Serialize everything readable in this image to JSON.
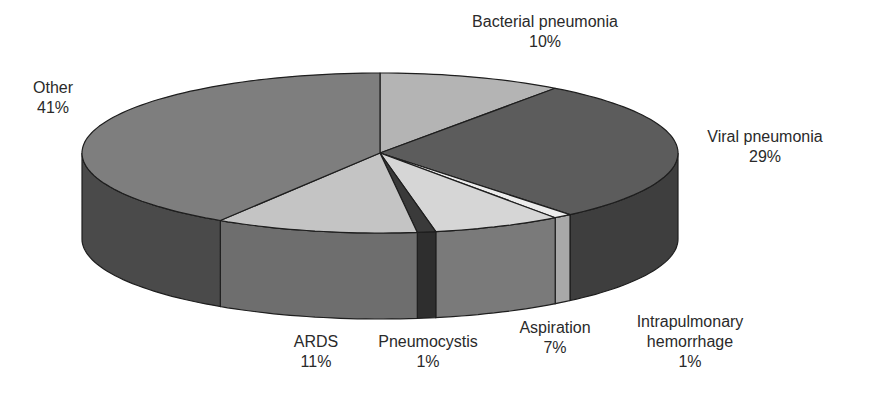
{
  "chart_data": {
    "type": "pie",
    "style": "3d-grayscale",
    "title": "",
    "start_angle_deg": 0,
    "direction": "clockwise",
    "slices": [
      {
        "name": "Bacterial pneumonia",
        "value": 10,
        "label_pct": "10%",
        "top": "#b4b4b4",
        "side": "#8c8c8c"
      },
      {
        "name": "Viral pneumonia",
        "value": 29,
        "label_pct": "29%",
        "top": "#5c5c5c",
        "side": "#3e3e3e"
      },
      {
        "name": "Intrapulmonary hemorrhage",
        "value": 1,
        "label_pct": "1%",
        "top": "#ececec",
        "side": "#a8a8a8"
      },
      {
        "name": "Aspiration",
        "value": 7,
        "label_pct": "7%",
        "top": "#d6d6d6",
        "side": "#7a7a7a"
      },
      {
        "name": "Pneumocystis",
        "value": 1,
        "label_pct": "1%",
        "top": "#3a3a3a",
        "side": "#2e2e2e"
      },
      {
        "name": "ARDS",
        "value": 11,
        "label_pct": "11%",
        "top": "#c4c4c4",
        "side": "#6e6e6e"
      },
      {
        "name": "Other",
        "value": 41,
        "label_pct": "41%",
        "top": "#7e7e7e",
        "side": "#4a4a4a"
      }
    ]
  },
  "labels": [
    {
      "line1": "Bacterial pneumonia",
      "line2": "10%",
      "line3": ""
    },
    {
      "line1": "Viral pneumonia",
      "line2": "29%",
      "line3": ""
    },
    {
      "line1": "Intrapulmonary",
      "line2": "hemorrhage",
      "line3": "1%"
    },
    {
      "line1": "Aspiration",
      "line2": "7%",
      "line3": ""
    },
    {
      "line1": "Pneumocystis",
      "line2": "1%",
      "line3": ""
    },
    {
      "line1": "ARDS",
      "line2": "11%",
      "line3": ""
    },
    {
      "line1": "Other",
      "line2": "41%",
      "line3": ""
    }
  ]
}
